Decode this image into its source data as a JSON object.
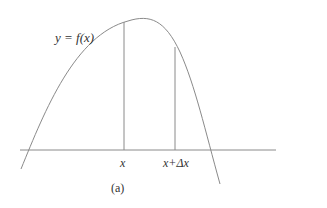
{
  "figure": {
    "curve_label": "y = f(x)",
    "tick_labels": [
      "x",
      "x+Δx"
    ],
    "caption": "(a)",
    "line_color": "#8a8a8a",
    "text_color": "#333333"
  }
}
